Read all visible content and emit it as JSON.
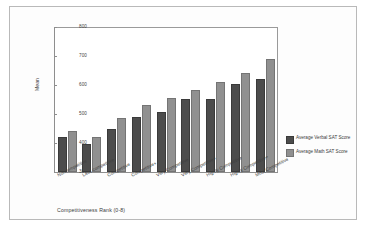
{
  "chart_data": {
    "type": "bar",
    "title": "",
    "xlabel": "Competitiveness Rank (0-8)",
    "ylabel": "Mean",
    "ylim": [
      300,
      800
    ],
    "yticks": [
      300,
      400,
      500,
      600,
      700,
      800
    ],
    "grid": false,
    "legend_position": "right",
    "categories": [
      "Noncompetitive",
      "Less competitive",
      "Competitive",
      "Competitive+",
      "Very Competitive",
      "Very Competitive+",
      "Highly Competitive",
      "Highly Competitive+",
      "Most Competitive"
    ],
    "series": [
      {
        "name": "Average Verbal SAT Score",
        "color": "#4c4c4c",
        "values": [
          421,
          397,
          450,
          490,
          508,
          552,
          552,
          603,
          621
        ]
      },
      {
        "name": "Average Math SAT Score",
        "color": "#909090",
        "values": [
          442,
          421,
          485,
          532,
          556,
          583,
          610,
          640,
          689
        ]
      }
    ]
  },
  "axis": {
    "y_title": "Mean",
    "x_title": "Competitiveness Rank (0-8)",
    "y_tick_labels": [
      "800",
      "700",
      "600",
      "500",
      "400",
      "300"
    ]
  },
  "legend": {
    "items": [
      {
        "label": "Average Verbal SAT Score",
        "line1": "Average Verbal SAT S",
        "line2": "core",
        "color": "#4c4c4c"
      },
      {
        "label": "Average Math SAT Score",
        "line1": "Average Math SAT Sco",
        "line2": "re",
        "color": "#909090"
      }
    ]
  }
}
